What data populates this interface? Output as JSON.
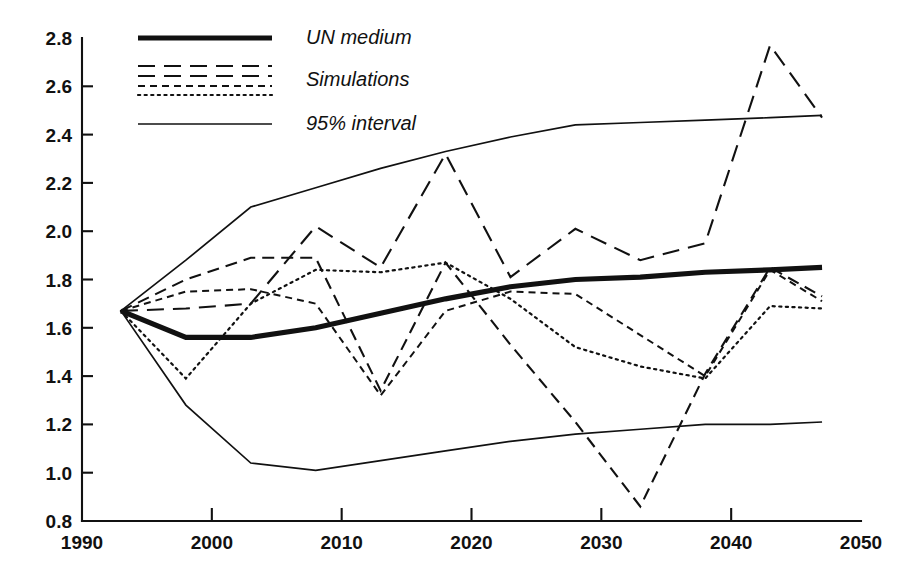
{
  "chart_data": {
    "type": "line",
    "title": "",
    "subtitle": "",
    "xlabel": "",
    "ylabel": "",
    "xlim": [
      1990,
      2050
    ],
    "ylim": [
      0.8,
      2.8
    ],
    "xticks": [
      1990,
      2000,
      2010,
      2020,
      2030,
      2040,
      2050
    ],
    "xtick_labels": [
      "1990",
      "2000",
      "2010",
      "2020",
      "2030",
      "2040",
      "2050"
    ],
    "yticks": [
      0.8,
      1.0,
      1.2,
      1.4,
      1.6,
      1.8,
      2.0,
      2.2,
      2.4,
      2.6,
      2.8
    ],
    "ytick_labels": [
      "0.8",
      "1.0",
      "1.2",
      "1.4",
      "1.6",
      "1.8",
      "2.0",
      "2.2",
      "2.4",
      "2.6",
      "2.8"
    ],
    "grid": false,
    "legend_position": "top-left",
    "line_color": "#111111",
    "background_color": "#ffffff",
    "series": [
      {
        "name": "UN medium",
        "style": "solid-thick",
        "x": [
          1993,
          1998,
          2003,
          2008,
          2013,
          2018,
          2023,
          2028,
          2033,
          2038,
          2043,
          2047
        ],
        "values": [
          1.67,
          1.56,
          1.56,
          1.6,
          1.66,
          1.72,
          1.77,
          1.8,
          1.81,
          1.83,
          1.84,
          1.85
        ]
      },
      {
        "name": "95% interval upper",
        "style": "solid-thin",
        "x": [
          1993,
          1998,
          2003,
          2008,
          2013,
          2018,
          2023,
          2028,
          2033,
          2038,
          2043,
          2047
        ],
        "values": [
          1.67,
          1.88,
          2.1,
          2.18,
          2.26,
          2.33,
          2.39,
          2.44,
          2.45,
          2.46,
          2.47,
          2.48
        ]
      },
      {
        "name": "95% interval lower",
        "style": "solid-thin",
        "x": [
          1993,
          1998,
          2003,
          2008,
          2013,
          2018,
          2023,
          2028,
          2033,
          2038,
          2043,
          2047
        ],
        "values": [
          1.67,
          1.28,
          1.04,
          1.01,
          1.05,
          1.09,
          1.13,
          1.16,
          1.18,
          1.2,
          1.2,
          1.21
        ]
      },
      {
        "name": "Simulation 1",
        "style": "long-dash",
        "x": [
          1993,
          1998,
          2003,
          2008,
          2013,
          2018,
          2023,
          2028,
          2033,
          2038,
          2043,
          2047
        ],
        "values": [
          1.67,
          1.68,
          1.7,
          2.02,
          1.85,
          2.32,
          1.81,
          2.01,
          1.88,
          1.95,
          2.77,
          2.47
        ]
      },
      {
        "name": "Simulation 2",
        "style": "medium-dash",
        "x": [
          1993,
          1998,
          2003,
          2008,
          2013,
          2018,
          2023,
          2028,
          2033,
          2038,
          2043,
          2047
        ],
        "values": [
          1.67,
          1.8,
          1.89,
          1.89,
          1.34,
          1.87,
          1.53,
          1.21,
          0.86,
          1.41,
          1.85,
          1.73
        ]
      },
      {
        "name": "Simulation 3",
        "style": "short-dash",
        "x": [
          1993,
          1998,
          2003,
          2008,
          2013,
          2018,
          2023,
          2028,
          2033,
          2038,
          2043,
          2047
        ],
        "values": [
          1.67,
          1.75,
          1.76,
          1.7,
          1.32,
          1.67,
          1.75,
          1.74,
          1.57,
          1.4,
          1.84,
          1.71
        ]
      },
      {
        "name": "Simulation 4",
        "style": "dotted",
        "x": [
          1993,
          1998,
          2003,
          2008,
          2013,
          2018,
          2023,
          2028,
          2033,
          2038,
          2043,
          2047
        ],
        "values": [
          1.67,
          1.39,
          1.7,
          1.84,
          1.83,
          1.87,
          1.72,
          1.52,
          1.44,
          1.39,
          1.69,
          1.68
        ]
      }
    ],
    "legend": [
      {
        "label": "UN medium",
        "style": "solid-thick"
      },
      {
        "label": "Simulations",
        "style": "multi-dash"
      },
      {
        "label": "95% interval",
        "style": "solid-thin"
      }
    ]
  },
  "axes": {
    "plot_left": 82,
    "plot_right": 861,
    "plot_top": 38,
    "plot_bottom": 521
  }
}
